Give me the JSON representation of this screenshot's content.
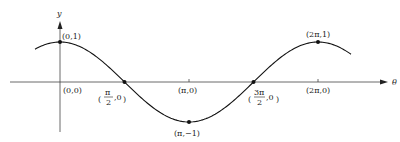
{
  "diagram": {
    "type": "cosine-graph",
    "function": "y = cos(theta)",
    "axes": {
      "x_label": "θ",
      "y_label": "y"
    },
    "points": [
      {
        "id": "p0",
        "label": "(0,1)"
      },
      {
        "id": "p_half_pi",
        "label_num": "π",
        "label_den": "2",
        "label_tail": ",0"
      },
      {
        "id": "p_pi",
        "label": "(π,−1)"
      },
      {
        "id": "p_three_half_pi",
        "label_num": "3π",
        "label_den": "2",
        "label_tail": ",0"
      },
      {
        "id": "p_two_pi",
        "label": "(2π,1)"
      }
    ],
    "axis_ticks": [
      {
        "id": "t0",
        "label": "(0,0)"
      },
      {
        "id": "t_pi",
        "label": "(π,0)"
      },
      {
        "id": "t_two_pi",
        "label": "(2π,0)"
      }
    ],
    "colors": {
      "curve": "#111111",
      "axes": "#333333",
      "background": "#ffffff"
    }
  }
}
